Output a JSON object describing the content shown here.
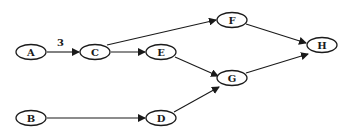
{
  "diagram": {
    "type": "directed-graph",
    "nodes": [
      {
        "id": "A",
        "label": "A",
        "cx": 31,
        "cy": 52
      },
      {
        "id": "B",
        "label": "B",
        "cx": 31,
        "cy": 118
      },
      {
        "id": "C",
        "label": "C",
        "cx": 95,
        "cy": 52
      },
      {
        "id": "D",
        "label": "D",
        "cx": 161,
        "cy": 118
      },
      {
        "id": "E",
        "label": "E",
        "cx": 161,
        "cy": 52
      },
      {
        "id": "F",
        "label": "F",
        "cx": 232,
        "cy": 20
      },
      {
        "id": "G",
        "label": "G",
        "cx": 232,
        "cy": 78
      },
      {
        "id": "H",
        "label": "H",
        "cx": 322,
        "cy": 45
      }
    ],
    "edges": [
      {
        "from": "A",
        "to": "C",
        "label": "3"
      },
      {
        "from": "C",
        "to": "F",
        "label": ""
      },
      {
        "from": "C",
        "to": "E",
        "label": ""
      },
      {
        "from": "E",
        "to": "G",
        "label": ""
      },
      {
        "from": "B",
        "to": "D",
        "label": ""
      },
      {
        "from": "D",
        "to": "G",
        "label": ""
      },
      {
        "from": "F",
        "to": "H",
        "label": ""
      },
      {
        "from": "G",
        "to": "H",
        "label": ""
      }
    ],
    "edge_label_A_C": "3"
  }
}
